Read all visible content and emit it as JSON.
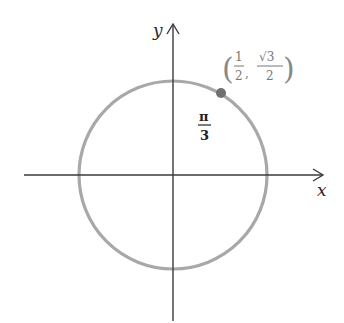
{
  "diagram": {
    "type": "unit-circle",
    "axes": {
      "x_label": "x",
      "y_label": "y"
    },
    "circle": {
      "center": [
        173,
        175
      ],
      "radius": 94,
      "color": "#a8a8a8"
    },
    "point": {
      "angle_label_num": "π",
      "angle_label_den": "3",
      "coord_x_num": "1",
      "coord_x_den": "2",
      "coord_y_num": "√3",
      "coord_y_den": "2",
      "separator": ",",
      "open_paren": "(",
      "close_paren": ")",
      "color": "#707070"
    },
    "colors": {
      "axis": "#3a3a3a",
      "background": "#ffffff"
    }
  }
}
